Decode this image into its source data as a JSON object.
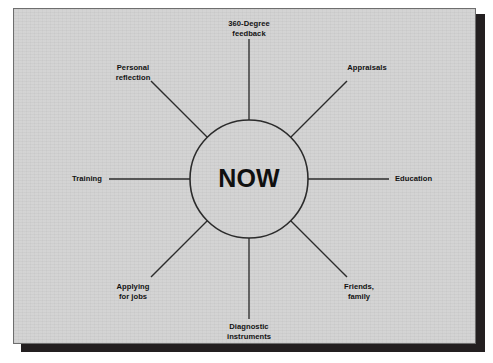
{
  "figure": {
    "center": {
      "label": "NOW"
    },
    "spokes": [
      {
        "id": "360-degree-feedback",
        "label": "360-Degree\nfeedback",
        "angle_deg": 90,
        "line": "vertical"
      },
      {
        "id": "appraisals",
        "label": "Appraisals",
        "angle_deg": 45,
        "line": "diagonal"
      },
      {
        "id": "education",
        "label": "Education",
        "angle_deg": 0,
        "line": "horizontal"
      },
      {
        "id": "friends-family",
        "label": "Friends,\nfamily",
        "angle_deg": -45,
        "line": "diagonal"
      },
      {
        "id": "diagnostic-instruments",
        "label": "Diagnostic\ninstruments",
        "angle_deg": -90,
        "line": "vertical"
      },
      {
        "id": "applying-for-jobs",
        "label": "Applying\nfor jobs",
        "angle_deg": -135,
        "line": "diagonal"
      },
      {
        "id": "training",
        "label": "Training",
        "angle_deg": 180,
        "line": "horizontal"
      },
      {
        "id": "personal-reflection",
        "label": "Personal\nreflection",
        "angle_deg": 135,
        "line": "diagonal"
      }
    ],
    "colors": {
      "panel_background": "#d2d2d2",
      "panel_border": "#6e6e6e",
      "shadow": "#231f20",
      "line": "#2b2b2b",
      "text": "#121212",
      "page_background": "#ffffff"
    }
  }
}
